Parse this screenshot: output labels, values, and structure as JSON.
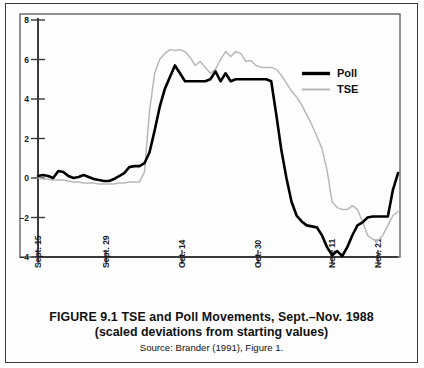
{
  "figure": {
    "caption_line1": "FIGURE 9.1  TSE and Poll Movements, Sept.–Nov. 1988",
    "caption_line2": "(scaled deviations from starting values)",
    "source": "Source: Brander (1991), Figure 1."
  },
  "chart_data": {
    "type": "line",
    "title": "FIGURE 9.1  TSE and Poll Movements, Sept.–Nov. 1988",
    "subtitle": "(scaled deviations from starting values)",
    "xlabel": "",
    "ylabel": "",
    "ylim": [
      -4,
      8
    ],
    "yticks": [
      8,
      6,
      4,
      2,
      0,
      -2,
      -4
    ],
    "ytick_labels": [
      "8",
      "6",
      "4",
      "2",
      "0",
      "–2",
      "–4"
    ],
    "xlim": [
      0,
      68
    ],
    "xticks": [
      0,
      10,
      21,
      32,
      43,
      50
    ],
    "xtick_labels": [
      "Sept. 15",
      "Sept. 29",
      "Oct. 14",
      "Oct. 30",
      "Nov. 11",
      "Nov. 21"
    ],
    "grid": false,
    "legend_position": "upper right",
    "colors": {
      "poll": "#000000",
      "tse": "#b8b8b8",
      "axis": "#3a3a3a",
      "frame": "#3a3a3a",
      "background": "#ffffff"
    },
    "series": [
      {
        "name": "Poll",
        "color": "#000000",
        "x": [
          0,
          1,
          2,
          3,
          4,
          5,
          6,
          7,
          8,
          9,
          10,
          11,
          12,
          13,
          14,
          15,
          16,
          17,
          18,
          19,
          20,
          21,
          22,
          23,
          24,
          25,
          26,
          27,
          28,
          29,
          30,
          31,
          32,
          33,
          34,
          35,
          36,
          37,
          38,
          39,
          40,
          41,
          42,
          43,
          44,
          45,
          46,
          47,
          48,
          49,
          50,
          51,
          52,
          53,
          54,
          55,
          56,
          57,
          58,
          59,
          60,
          61,
          62,
          63,
          64,
          65,
          66,
          67,
          68
        ],
        "values": [
          0.1,
          0.15,
          0.1,
          0.0,
          0.35,
          0.3,
          0.1,
          0.0,
          0.05,
          0.15,
          0.05,
          -0.05,
          -0.1,
          -0.15,
          -0.15,
          -0.05,
          0.1,
          0.25,
          0.55,
          0.6,
          0.6,
          0.75,
          1.3,
          2.4,
          3.6,
          4.5,
          5.1,
          5.7,
          5.3,
          4.9,
          4.9,
          4.9,
          4.9,
          4.9,
          5.0,
          5.4,
          4.9,
          5.3,
          4.9,
          5.0,
          5.0,
          5.0,
          5.0,
          5.0,
          5.0,
          5.0,
          4.9,
          3.2,
          1.4,
          0.0,
          -1.2,
          -1.9,
          -2.2,
          -2.4,
          -2.45,
          -2.5,
          -2.9,
          -3.5,
          -3.9,
          -3.7,
          -3.95,
          -3.5,
          -2.9,
          -2.4,
          -2.25,
          -2.0,
          -1.95,
          -1.95,
          -1.95
        ],
        "tail_x": [
          68,
          69,
          70,
          71
        ],
        "tail_values": [
          -1.95,
          -1.95,
          -0.6,
          0.25
        ]
      },
      {
        "name": "TSE",
        "color": "#b8b8b8",
        "x": [
          0,
          1,
          2,
          3,
          4,
          5,
          6,
          7,
          8,
          9,
          10,
          11,
          12,
          13,
          14,
          15,
          16,
          17,
          18,
          19,
          20,
          21,
          22,
          23,
          24,
          25,
          26,
          27,
          28,
          29,
          30,
          31,
          32,
          33,
          34,
          35,
          36,
          37,
          38,
          39,
          40,
          41,
          42,
          43,
          44,
          45,
          46,
          47,
          48,
          49,
          50,
          51,
          52,
          53,
          54,
          55,
          56,
          57,
          58,
          59,
          60,
          61,
          62,
          63,
          64,
          65,
          66,
          67,
          68,
          69,
          70,
          71
        ],
        "values": [
          0.0,
          -0.05,
          -0.05,
          -0.1,
          -0.1,
          -0.1,
          -0.15,
          -0.2,
          -0.2,
          -0.25,
          -0.25,
          -0.25,
          -0.3,
          -0.3,
          -0.3,
          -0.3,
          -0.25,
          -0.25,
          -0.2,
          -0.2,
          -0.2,
          0.3,
          3.4,
          5.3,
          6.0,
          6.3,
          6.5,
          6.45,
          6.5,
          6.4,
          6.1,
          5.7,
          5.9,
          5.6,
          5.3,
          5.5,
          6.0,
          6.4,
          6.15,
          6.4,
          6.3,
          5.9,
          5.95,
          5.7,
          5.6,
          5.6,
          5.6,
          5.5,
          5.2,
          4.8,
          4.4,
          4.1,
          3.7,
          3.2,
          2.7,
          2.1,
          1.5,
          0.4,
          -1.2,
          -1.5,
          -1.6,
          -1.6,
          -1.4,
          -1.6,
          -2.2,
          -2.9,
          -3.1,
          -3.2,
          -2.9,
          -2.4,
          -1.9,
          -1.7
        ]
      }
    ],
    "legend": [
      {
        "label": "Poll",
        "color": "#000000",
        "style": "thick-solid"
      },
      {
        "label": "TSE",
        "color": "#b8b8b8",
        "style": "thin-solid"
      }
    ]
  }
}
